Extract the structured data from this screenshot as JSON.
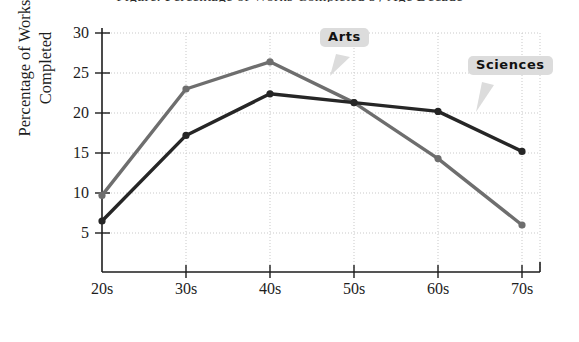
{
  "chart_data": {
    "type": "line",
    "title": "Figure: Percentage of Works Completed by Age Decade",
    "xlabel": "Age Decade",
    "ylabel": "Percentage of Works Completed",
    "ylabel_line1": "Percentage of Works",
    "ylabel_line2": "Completed",
    "categories": [
      "20s",
      "30s",
      "40s",
      "50s",
      "60s",
      "70s"
    ],
    "xtick_labels": [
      "20s",
      "30s",
      "40s",
      "50s",
      "60s",
      "70s"
    ],
    "ytick_labels": [
      "5",
      "10",
      "15",
      "20",
      "25",
      "30"
    ],
    "yticks": [
      5,
      10,
      15,
      20,
      25,
      30
    ],
    "ylim": [
      0,
      30
    ],
    "xlim": [
      "20s",
      "70s"
    ],
    "grid": true,
    "grid_style": "dotted",
    "legend_position": "inline-callouts",
    "series": [
      {
        "name": "Arts",
        "color": "#6e6e6e",
        "marker": "circle",
        "values": [
          9.7,
          23.0,
          26.4,
          21.3,
          14.3,
          6.0
        ]
      },
      {
        "name": "Sciences",
        "color": "#262626",
        "marker": "circle",
        "values": [
          6.5,
          17.2,
          22.4,
          21.3,
          20.2,
          15.2
        ]
      }
    ],
    "annotations": [
      {
        "label": "Arts",
        "points_to": "40s-50s segment of Arts line"
      },
      {
        "label": "Sciences",
        "points_to": "60s point of Sciences line"
      }
    ]
  },
  "callouts": {
    "arts": "Arts",
    "sciences": "Sciences"
  },
  "axes": {
    "y_title_line1": "Percentage of Works",
    "y_title_line2": "Completed",
    "x_title": "Age Decade"
  },
  "colors": {
    "arts_line": "#6e6e6e",
    "sciences_line": "#262626",
    "grid": "#c9c9c9",
    "axis": "#1d1d1d",
    "callout_bg": "#dcdcdc",
    "background": "#ffffff"
  }
}
